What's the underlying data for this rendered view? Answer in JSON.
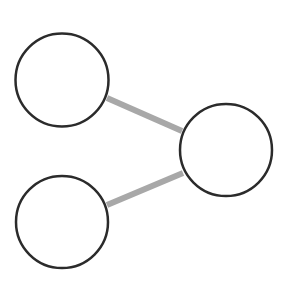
{
  "diagram": {
    "type": "graph",
    "background": "#ffffff",
    "node_stroke": "#2b2b2b",
    "node_fill": "#ffffff",
    "edge_color": "#a8a8a8",
    "nodes": [
      {
        "id": "node-top-left",
        "label": "",
        "cx": 62,
        "cy": 80,
        "r": 47
      },
      {
        "id": "node-right",
        "label": "",
        "cx": 226,
        "cy": 150,
        "r": 46
      },
      {
        "id": "node-bottom-left",
        "label": "",
        "cx": 62,
        "cy": 222,
        "r": 46
      }
    ],
    "edges": [
      {
        "from": "node-top-left",
        "to": "node-right"
      },
      {
        "from": "node-bottom-left",
        "to": "node-right"
      }
    ]
  }
}
